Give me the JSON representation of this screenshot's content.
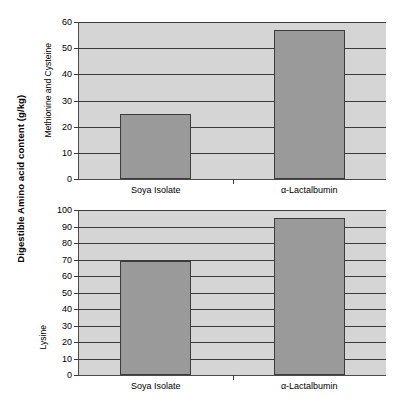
{
  "figure": {
    "axis_title": "Digestible Amino acid content (g/kg)",
    "bar_color": "#9a9a9a",
    "plot_bg_color": "#d5d5d5",
    "axis_color": "#3a3a3a"
  },
  "chart_data": [
    {
      "type": "bar",
      "title": "",
      "ylabel": "Methionine and Cysteine",
      "xlabel": "",
      "categories": [
        "Soya Isolate",
        "α-Lactalbumin"
      ],
      "values": [
        25,
        57
      ],
      "ylim": [
        0,
        60
      ],
      "yticks": [
        0,
        10,
        20,
        30,
        40,
        50,
        60
      ],
      "ytick_labels": [
        "0",
        "10",
        "20",
        "30",
        "40",
        "50",
        "60"
      ],
      "grid": true,
      "legend": false
    },
    {
      "type": "bar",
      "title": "",
      "ylabel": "Lysine",
      "xlabel": "",
      "categories": [
        "Soya Isolate",
        "α-Lactalbumin"
      ],
      "values": [
        69,
        95
      ],
      "ylim": [
        0,
        100
      ],
      "yticks": [
        0,
        10,
        20,
        30,
        40,
        50,
        60,
        70,
        80,
        90,
        100
      ],
      "ytick_labels": [
        "0",
        "10",
        "20",
        "30",
        "40",
        "50",
        "60",
        "70",
        "80",
        "90",
        "100"
      ],
      "grid": true,
      "legend": false
    }
  ]
}
